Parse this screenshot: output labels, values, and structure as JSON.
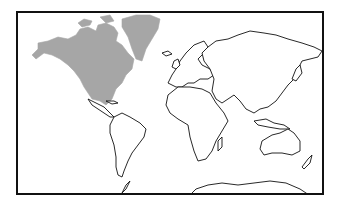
{
  "map": {
    "type": "world-outline-map",
    "projection": "equirectangular-like",
    "highlighted_region": "North America (incl. Greenland)",
    "colors": {
      "highlight_fill": "#a6a6a6",
      "land_fill": "#ffffff",
      "coastline": "#111111",
      "frame": "#111111",
      "background": "#ffffff"
    },
    "regions": [
      {
        "name": "North America",
        "highlighted": true
      },
      {
        "name": "Greenland",
        "highlighted": true
      },
      {
        "name": "South America",
        "highlighted": false
      },
      {
        "name": "Europe",
        "highlighted": false
      },
      {
        "name": "Africa",
        "highlighted": false
      },
      {
        "name": "Asia",
        "highlighted": false
      },
      {
        "name": "Australia",
        "highlighted": false
      },
      {
        "name": "Antarctica",
        "highlighted": false
      }
    ]
  }
}
